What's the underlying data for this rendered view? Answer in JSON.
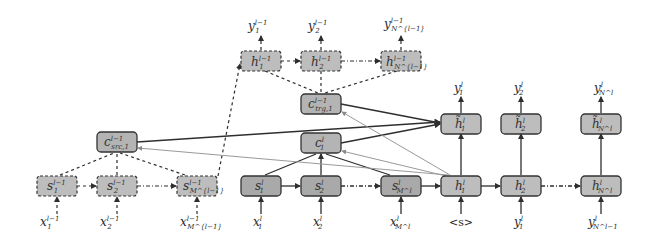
{
  "diagram": {
    "colors": {
      "box_fill": "#b9b9b9",
      "box_fill_dark": "#a9a9a9",
      "box_stroke": "#3a3a3a",
      "edge": "#2e2e2e",
      "edge_light": "#9a9a9a"
    },
    "prev_decoder": {
      "outputs": [
        {
          "base": "y",
          "sub": "1",
          "sup": "l−1"
        },
        {
          "base": "y",
          "sub": "2",
          "sup": "l−1"
        },
        {
          "base": "y",
          "sub": "N^{l−1}",
          "sup": "l−1"
        }
      ],
      "states": [
        {
          "base": "h",
          "sub": "1",
          "sup": "l−1"
        },
        {
          "base": "h",
          "sub": "2",
          "sup": "l−1"
        },
        {
          "base": "h",
          "sub": "N^{l−1}",
          "sup": "l−1"
        }
      ],
      "context": {
        "base": "c",
        "sub": "trg,1",
        "sup": "l−1"
      }
    },
    "prev_encoder": {
      "context": {
        "base": "c",
        "sub": "src,1",
        "sup": "l−1"
      },
      "states": [
        {
          "base": "s",
          "sub": "1",
          "sup": "l−1"
        },
        {
          "base": "s",
          "sub": "2",
          "sup": "l−1"
        },
        {
          "base": "s",
          "sub": "M^{l−1}",
          "sup": "l−1"
        }
      ],
      "inputs": [
        {
          "base": "x",
          "sub": "1",
          "sup": "l−1"
        },
        {
          "base": "x",
          "sub": "2",
          "sup": "l−1"
        },
        {
          "base": "x",
          "sub": "M^{l−1}",
          "sup": "l−1"
        }
      ]
    },
    "cur_encoder": {
      "context": {
        "base": "c",
        "sub": "1",
        "sup": "l"
      },
      "states": [
        {
          "base": "s",
          "sub": "1",
          "sup": "l"
        },
        {
          "base": "s",
          "sub": "2",
          "sup": "l"
        },
        {
          "base": "s",
          "sub": "M^l",
          "sup": "l"
        }
      ],
      "inputs": [
        {
          "base": "x",
          "sub": "1",
          "sup": "l"
        },
        {
          "base": "x",
          "sub": "2",
          "sup": "l"
        },
        {
          "base": "x",
          "sub": "M^l",
          "sup": "l"
        }
      ]
    },
    "cur_decoder": {
      "outputs": [
        {
          "base": "y",
          "sub": "1",
          "sup": "l"
        },
        {
          "base": "y",
          "sub": "2",
          "sup": "l"
        },
        {
          "base": "y",
          "sub": "N^l",
          "sup": "l"
        }
      ],
      "attn_states": [
        {
          "base": "h̃",
          "sub": "1",
          "sup": "l"
        },
        {
          "base": "h̃",
          "sub": "2",
          "sup": "l"
        },
        {
          "base": "h̃",
          "sub": "N^l",
          "sup": "l"
        }
      ],
      "states": [
        {
          "base": "h",
          "sub": "1",
          "sup": "l"
        },
        {
          "base": "h",
          "sub": "2",
          "sup": "l"
        },
        {
          "base": "h",
          "sub": "N^l",
          "sup": "l"
        }
      ],
      "inputs": [
        {
          "text": "<s>"
        },
        {
          "base": "y",
          "sub": "1",
          "sup": "l"
        },
        {
          "base": "y",
          "sub": "N^l−1",
          "sup": "l"
        }
      ]
    },
    "ellipsis": "· · ·"
  }
}
